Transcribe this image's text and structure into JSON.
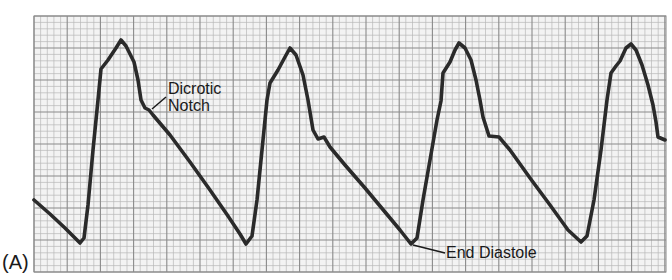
{
  "panel_label": "(A)",
  "annotations": {
    "dicrotic_line1": "Dicrotic",
    "dicrotic_line2": "Notch",
    "end_diastole": "End Diastole"
  },
  "colors": {
    "grid_minor": "#b8b8b8",
    "grid_major": "#8a8a8a",
    "grid_bg": "#f2f2f2",
    "trace": "#2a2a2a",
    "text": "#1a1a1a"
  },
  "chart_data": {
    "type": "line",
    "title": "",
    "xlabel": "",
    "ylabel": "",
    "grid": true,
    "plot_area_px": {
      "x0": 34,
      "y0": 16,
      "x1": 666,
      "y1": 272
    },
    "grid_px": {
      "major_x": 33.2,
      "major_y": 32,
      "minor_per_major": 5
    },
    "series": [
      {
        "name": "arterial pressure trace",
        "points_px": [
          [
            34,
            200
          ],
          [
            50,
            214
          ],
          [
            65,
            228
          ],
          [
            80,
            243
          ],
          [
            84,
            238
          ],
          [
            88,
            205
          ],
          [
            93,
            150
          ],
          [
            98,
            100
          ],
          [
            101,
            69
          ],
          [
            108,
            60
          ],
          [
            116,
            48
          ],
          [
            121,
            40
          ],
          [
            126,
            46
          ],
          [
            134,
            62
          ],
          [
            138,
            80
          ],
          [
            141,
            100
          ],
          [
            145,
            108
          ],
          [
            149,
            110
          ],
          [
            153,
            115
          ],
          [
            170,
            135
          ],
          [
            190,
            162
          ],
          [
            210,
            190
          ],
          [
            228,
            216
          ],
          [
            240,
            234
          ],
          [
            246,
            244
          ],
          [
            252,
            236
          ],
          [
            257,
            200
          ],
          [
            262,
            150
          ],
          [
            267,
            100
          ],
          [
            270,
            83
          ],
          [
            278,
            70
          ],
          [
            285,
            57
          ],
          [
            290,
            48
          ],
          [
            296,
            55
          ],
          [
            303,
            75
          ],
          [
            308,
            100
          ],
          [
            313,
            130
          ],
          [
            318,
            139
          ],
          [
            324,
            137
          ],
          [
            330,
            147
          ],
          [
            345,
            165
          ],
          [
            365,
            188
          ],
          [
            385,
            212
          ],
          [
            400,
            230
          ],
          [
            411,
            244
          ],
          [
            417,
            238
          ],
          [
            423,
            200
          ],
          [
            430,
            160
          ],
          [
            437,
            120
          ],
          [
            441,
            101
          ],
          [
            443,
            73
          ],
          [
            450,
            62
          ],
          [
            455,
            50
          ],
          [
            459,
            43
          ],
          [
            465,
            48
          ],
          [
            471,
            60
          ],
          [
            476,
            80
          ],
          [
            480,
            100
          ],
          [
            483,
            117
          ],
          [
            489,
            136
          ],
          [
            499,
            137
          ],
          [
            510,
            150
          ],
          [
            530,
            178
          ],
          [
            550,
            205
          ],
          [
            568,
            230
          ],
          [
            581,
            242
          ],
          [
            587,
            236
          ],
          [
            594,
            200
          ],
          [
            601,
            150
          ],
          [
            607,
            100
          ],
          [
            611,
            73
          ],
          [
            616,
            66
          ],
          [
            620,
            61
          ],
          [
            626,
            48
          ],
          [
            631,
            44
          ],
          [
            636,
            50
          ],
          [
            642,
            65
          ],
          [
            648,
            85
          ],
          [
            653,
            105
          ],
          [
            656,
            122
          ],
          [
            658,
            137
          ],
          [
            665,
            140
          ]
        ]
      }
    ],
    "annotations": [
      {
        "text": "Dicrotic Notch",
        "target_px": [
          151,
          111
        ],
        "label_px": [
          168,
          80
        ]
      },
      {
        "text": "End Diastole",
        "target_px": [
          411,
          244
        ],
        "label_px": [
          446,
          244
        ]
      }
    ]
  }
}
